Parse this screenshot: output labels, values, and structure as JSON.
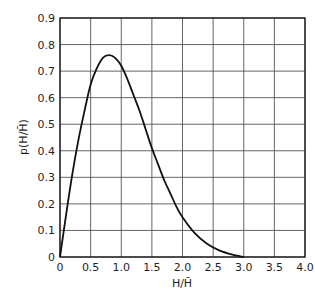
{
  "chart_data": {
    "type": "line",
    "title": "",
    "xlabel": "H/H̄",
    "ylabel": "p(H/H̄)",
    "xlim": [
      0,
      4.0
    ],
    "ylim": [
      0,
      0.9
    ],
    "grid": true,
    "legend": null,
    "x_ticks": [
      "0",
      "0.5",
      "1.0",
      "1.5",
      "2.0",
      "2.5",
      "3.0",
      "3.5",
      "4.0"
    ],
    "y_ticks": [
      "0",
      "0.1",
      "0.2",
      "0.3",
      "0.4",
      "0.5",
      "0.6",
      "0.7",
      "0.8",
      "0.9"
    ],
    "series": [
      {
        "name": "p(H/H̄)",
        "x": [
          0,
          0.1,
          0.2,
          0.3,
          0.4,
          0.5,
          0.6,
          0.7,
          0.8,
          0.9,
          1.0,
          1.1,
          1.2,
          1.3,
          1.4,
          1.5,
          1.6,
          1.7,
          1.8,
          1.9,
          2.0,
          2.2,
          2.4,
          2.6,
          2.8,
          3.0
        ],
        "y": [
          0,
          0.16,
          0.31,
          0.44,
          0.55,
          0.65,
          0.71,
          0.75,
          0.76,
          0.75,
          0.72,
          0.67,
          0.61,
          0.55,
          0.48,
          0.41,
          0.35,
          0.29,
          0.24,
          0.19,
          0.15,
          0.09,
          0.05,
          0.025,
          0.01,
          0.0
        ]
      }
    ]
  }
}
